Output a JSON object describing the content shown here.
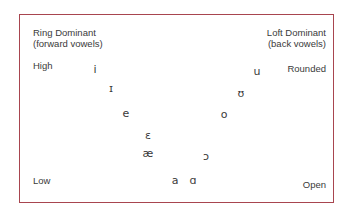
{
  "diagram": {
    "frame_color": "#a8454f",
    "labels": {
      "ring_dominant": "Ring Dominant",
      "forward_vowels": "(forward vowels)",
      "loft_dominant": "Loft Dominant",
      "back_vowels": "(back vowels)",
      "high": "High",
      "rounded": "Rounded",
      "low": "Low",
      "open": "Open"
    },
    "vowels": [
      {
        "symbol": "i",
        "x": 95,
        "y": 70
      },
      {
        "symbol": "ɪ",
        "x": 111,
        "y": 89
      },
      {
        "symbol": "e",
        "x": 126,
        "y": 114
      },
      {
        "symbol": "ɛ",
        "x": 148,
        "y": 136
      },
      {
        "symbol": "æ",
        "x": 148,
        "y": 154
      },
      {
        "symbol": "a",
        "x": 175,
        "y": 181
      },
      {
        "symbol": "ɑ",
        "x": 193,
        "y": 181
      },
      {
        "symbol": "ɔ",
        "x": 206,
        "y": 157
      },
      {
        "symbol": "o",
        "x": 224,
        "y": 115
      },
      {
        "symbol": "ʊ",
        "x": 241,
        "y": 94
      },
      {
        "symbol": "u",
        "x": 257,
        "y": 72
      }
    ]
  }
}
